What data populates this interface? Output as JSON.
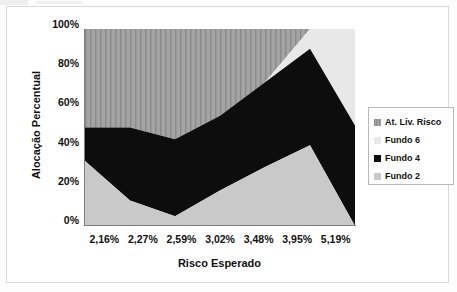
{
  "chart_data": {
    "type": "area",
    "title": "",
    "subtitle": "",
    "xlabel": "Risco Esperado",
    "ylabel": "Alocação Percentual",
    "stacked": "100%",
    "grid": false,
    "legend_position": "right",
    "ylim": [
      0,
      100
    ],
    "ytick_labels": [
      "100%",
      "80%",
      "60%",
      "40%",
      "20%",
      "0%"
    ],
    "ytick_values": [
      100,
      80,
      60,
      40,
      20,
      0
    ],
    "categories": [
      "2,16%",
      "2,27%",
      "2,59%",
      "3,02%",
      "3,48%",
      "3,95%",
      "5,19%"
    ],
    "series": [
      {
        "name": "Fundo 2",
        "stack_order": 1,
        "color": "#c9c9c9",
        "fill": "solid",
        "values": [
          33,
          13,
          5,
          18,
          30,
          41,
          0
        ]
      },
      {
        "name": "Fundo 4",
        "stack_order": 2,
        "color": "#0d0d0d",
        "fill": "solid",
        "values": [
          17,
          37,
          39,
          38,
          43,
          49,
          51
        ]
      },
      {
        "name": "Fundo 6",
        "stack_order": 3,
        "color": "#e8e8e8",
        "fill": "solid",
        "values": [
          0,
          0,
          0,
          0,
          0,
          10,
          49
        ]
      },
      {
        "name": "At. Liv. Risco",
        "stack_order": 4,
        "color": "#a0a0a0",
        "fill": "vertical-hatch",
        "values": [
          50,
          50,
          56,
          44,
          27,
          0,
          0
        ]
      }
    ],
    "cumulative_boundaries": {
      "note": "cumulative top edge of each band, bottom to top, in percent",
      "fundo2_top": [
        33,
        13,
        5,
        18,
        30,
        41,
        0
      ],
      "fundo4_top": [
        50,
        50,
        44,
        56,
        73,
        90,
        51
      ],
      "fundo6_top": [
        50,
        50,
        44,
        56,
        73,
        100,
        100
      ],
      "atlivrisco_top": [
        100,
        100,
        100,
        100,
        100,
        100,
        100
      ]
    }
  },
  "legend": {
    "items": [
      {
        "label": "At. Liv. Risco",
        "swatch_name": "legend-swatch-at-liv-risco",
        "color": "#a0a0a0",
        "pattern": "vertical-hatch"
      },
      {
        "label": "Fundo 6",
        "swatch_name": "legend-swatch-fundo-6",
        "color": "#e8e8e8",
        "pattern": "solid"
      },
      {
        "label": "Fundo 4",
        "swatch_name": "legend-swatch-fundo-4",
        "color": "#0d0d0d",
        "pattern": "solid"
      },
      {
        "label": "Fundo 2",
        "swatch_name": "legend-swatch-fundo-2",
        "color": "#c9c9c9",
        "pattern": "solid"
      }
    ]
  },
  "axes": {
    "x_title": "Risco Esperado",
    "y_title": "Alocação Percentual",
    "y_ticks": [
      "100%",
      "80%",
      "60%",
      "40%",
      "20%",
      "0%"
    ],
    "x_ticks": [
      "2,16%",
      "2,27%",
      "2,59%",
      "3,02%",
      "3,48%",
      "3,95%",
      "5,19%"
    ]
  },
  "colors": {
    "background": "#ffffff",
    "frame_border": "#d9d9d9",
    "axis_line": "#7f7f7f",
    "text": "#111111",
    "fundo2": "#c9c9c9",
    "fundo4": "#0d0d0d",
    "fundo6": "#e8e8e8",
    "at_liv_risco": "#a0a0a0"
  }
}
